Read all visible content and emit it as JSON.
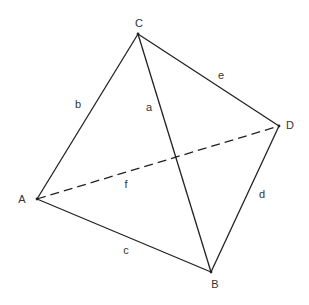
{
  "figure": {
    "vertices": {
      "A": {
        "label": "A",
        "x": 37,
        "y": 199,
        "lx": 22,
        "ly": 199
      },
      "B": {
        "label": "B",
        "x": 211,
        "y": 272,
        "lx": 215,
        "ly": 284
      },
      "C": {
        "label": "C",
        "x": 138,
        "y": 34,
        "lx": 139,
        "ly": 23
      },
      "D": {
        "label": "D",
        "x": 279,
        "y": 126,
        "lx": 290,
        "ly": 125
      }
    },
    "edges": [
      {
        "label": "a",
        "from": "C",
        "to": "B",
        "style": "solid",
        "lx": 149,
        "ly": 107
      },
      {
        "label": "b",
        "from": "A",
        "to": "C",
        "style": "solid",
        "lx": 78,
        "ly": 104
      },
      {
        "label": "c",
        "from": "A",
        "to": "B",
        "style": "solid",
        "lx": 126,
        "ly": 250
      },
      {
        "label": "d",
        "from": "B",
        "to": "D",
        "style": "solid",
        "lx": 262,
        "ly": 194
      },
      {
        "label": "e",
        "from": "C",
        "to": "D",
        "style": "solid",
        "lx": 221,
        "ly": 75
      },
      {
        "label": "f",
        "from": "A",
        "to": "D",
        "style": "dashed",
        "lx": 126,
        "ly": 184
      }
    ]
  }
}
